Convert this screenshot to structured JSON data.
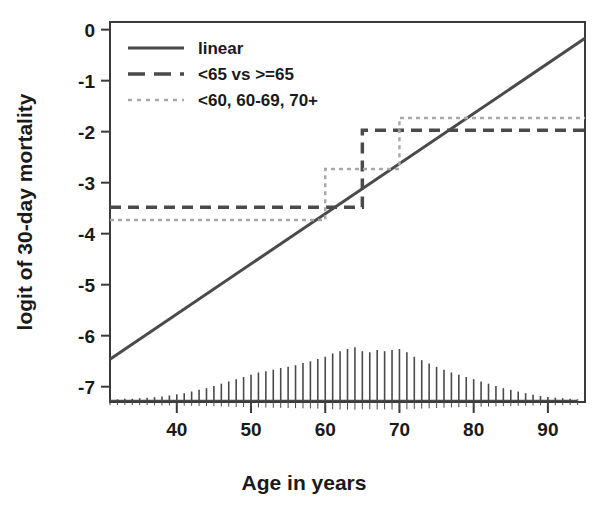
{
  "chart_data": {
    "type": "line",
    "title": "",
    "xlabel": "Age in years",
    "ylabel": "logit of 30-day mortality",
    "xlim": [
      31,
      95
    ],
    "ylim": [
      -7.3,
      0.15
    ],
    "xticks": [
      40,
      50,
      60,
      70,
      80,
      90
    ],
    "xtick_labels": [
      "40",
      "50",
      "60",
      "70",
      "80",
      "90"
    ],
    "yticks": [
      0,
      -1,
      -2,
      -3,
      -4,
      -5,
      -6,
      -7
    ],
    "ytick_labels": [
      "0",
      "-1",
      "-2",
      "-3",
      "-4",
      "-5",
      "-6",
      "-7"
    ],
    "grid": false,
    "legend_position": "top-left",
    "series": [
      {
        "name": "linear",
        "style": "solid",
        "color": "#4a4a4a",
        "type": "line",
        "x": [
          31,
          95
        ],
        "y": [
          -6.46,
          -0.17
        ]
      },
      {
        "name": "<65 vs >=65",
        "style": "dashed",
        "color": "#4a4a4a",
        "type": "step",
        "breakpoints": [
          65
        ],
        "x": [
          31,
          65,
          65,
          95
        ],
        "y": [
          -3.48,
          -3.48,
          -1.97,
          -1.97
        ]
      },
      {
        "name": "<60, 60-69, 70+",
        "style": "dotted",
        "color": "#a8a8a8",
        "type": "step",
        "breakpoints": [
          60,
          70
        ],
        "x": [
          31,
          60,
          60,
          70,
          70,
          95
        ],
        "y": [
          -3.73,
          -3.73,
          -2.73,
          -2.73,
          -1.73,
          -1.73
        ]
      }
    ],
    "rug": {
      "name": "age-distribution-rug",
      "baseline_y": -7.27,
      "x": [
        31,
        32,
        33,
        34,
        35,
        36,
        37,
        38,
        39,
        40,
        41,
        42,
        43,
        44,
        45,
        46,
        47,
        48,
        49,
        50,
        51,
        52,
        53,
        54,
        55,
        56,
        57,
        58,
        59,
        60,
        61,
        62,
        63,
        64,
        65,
        66,
        67,
        68,
        69,
        70,
        71,
        72,
        73,
        74,
        75,
        76,
        77,
        78,
        79,
        80,
        81,
        82,
        83,
        84,
        85,
        86,
        87,
        88,
        89,
        90,
        91,
        92,
        93,
        94
      ],
      "heights": [
        0.02,
        0.02,
        0.03,
        0.03,
        0.04,
        0.05,
        0.06,
        0.07,
        0.09,
        0.11,
        0.13,
        0.16,
        0.19,
        0.22,
        0.26,
        0.3,
        0.34,
        0.38,
        0.42,
        0.46,
        0.5,
        0.52,
        0.55,
        0.58,
        0.6,
        0.63,
        0.67,
        0.7,
        0.74,
        0.78,
        0.84,
        0.88,
        0.92,
        0.95,
        0.88,
        0.86,
        0.9,
        0.88,
        0.9,
        0.92,
        0.86,
        0.78,
        0.72,
        0.66,
        0.6,
        0.55,
        0.5,
        0.46,
        0.42,
        0.38,
        0.34,
        0.3,
        0.26,
        0.22,
        0.19,
        0.16,
        0.13,
        0.1,
        0.08,
        0.06,
        0.05,
        0.04,
        0.03,
        0.02
      ]
    }
  },
  "legend": {
    "items": [
      {
        "label": "linear",
        "style": "solid"
      },
      {
        "label": "<65 vs >=65",
        "style": "dashed"
      },
      {
        "label": "<60, 60-69, 70+",
        "style": "dotted"
      }
    ]
  },
  "colors": {
    "linear": "#4a4a4a",
    "binary": "#4a4a4a",
    "tertiary": "#a8a8a8",
    "frame": "#3a3a3a",
    "text": "#1a1a1a",
    "background": "#ffffff"
  }
}
